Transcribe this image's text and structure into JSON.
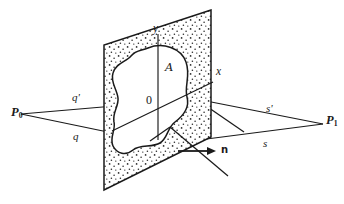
{
  "figure": {
    "title": "",
    "kind": "geometry-diagram",
    "background_color": "#ffffff",
    "ink_color": "#1a1a1a",
    "stipple_color": "#2b2b2b",
    "labels": {
      "source_point": "P",
      "source_point_sub": "0",
      "field_point": "P",
      "field_point_sub": "1",
      "ray_q_prime": "q'",
      "ray_q": "q",
      "ray_s_prime": "s'",
      "ray_s": "s",
      "axis_x": "x",
      "axis_y": "y",
      "origin": "0",
      "aperture_region": "A",
      "normal_vector": "n"
    },
    "elements": {
      "vertical_plane": "stippled screen plane",
      "aperture": "irregular blob aperture region",
      "horizontal_plane": "ray fan plane",
      "normal_arrow": "surface normal arrow"
    }
  }
}
